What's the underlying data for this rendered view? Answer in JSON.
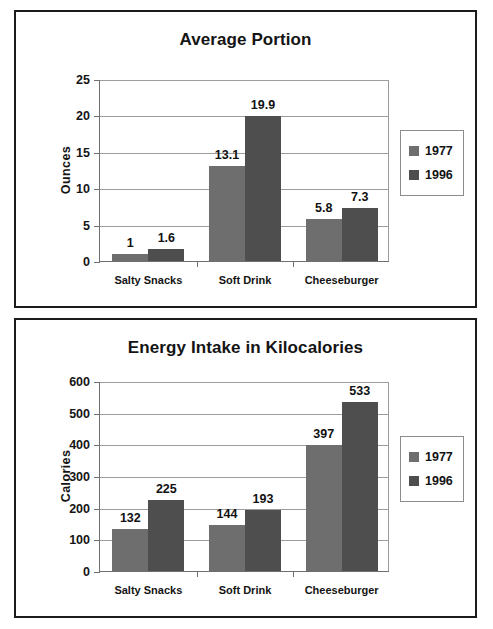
{
  "figure": {
    "panel_count": 2,
    "series_colors": {
      "1977": "#6e6e6e",
      "1996": "#4e4e4e"
    }
  },
  "legend": {
    "entries": [
      {
        "label": "1977",
        "color": "#6e6e6e"
      },
      {
        "label": "1996",
        "color": "#4e4e4e"
      }
    ]
  },
  "chart_data": [
    {
      "type": "bar",
      "title": "Average Portion",
      "xlabel": "",
      "ylabel": "Ounces",
      "categories": [
        "Salty Snacks",
        "Soft Drink",
        "Cheeseburger"
      ],
      "series": [
        {
          "name": "1977",
          "values": [
            1,
            13.1,
            5.8
          ],
          "labels": [
            "1",
            "13.1",
            "5.8"
          ],
          "color": "#6e6e6e"
        },
        {
          "name": "1996",
          "values": [
            1.6,
            19.9,
            7.3
          ],
          "labels": [
            "1.6",
            "19.9",
            "7.3"
          ],
          "color": "#4e4e4e"
        }
      ],
      "ylim": [
        0,
        25
      ],
      "yticks": [
        0,
        5,
        10,
        15,
        20,
        25
      ],
      "ytick_labels": [
        "0",
        "5",
        "10",
        "15",
        "20",
        "25"
      ],
      "grid": true,
      "legend_position": "right-outside"
    },
    {
      "type": "bar",
      "title": "Energy Intake in Kilocalories",
      "xlabel": "",
      "ylabel": "Calories",
      "categories": [
        "Salty Snacks",
        "Soft Drink",
        "Cheeseburger"
      ],
      "series": [
        {
          "name": "1977",
          "values": [
            132,
            144,
            397
          ],
          "labels": [
            "132",
            "144",
            "397"
          ],
          "color": "#6e6e6e"
        },
        {
          "name": "1996",
          "values": [
            225,
            193,
            533
          ],
          "labels": [
            "225",
            "193",
            "533"
          ],
          "color": "#4e4e4e"
        }
      ],
      "ylim": [
        0,
        600
      ],
      "yticks": [
        0,
        100,
        200,
        300,
        400,
        500,
        600
      ],
      "ytick_labels": [
        "0",
        "100",
        "200",
        "300",
        "400",
        "500",
        "600"
      ],
      "grid": true,
      "legend_position": "right-outside"
    }
  ]
}
